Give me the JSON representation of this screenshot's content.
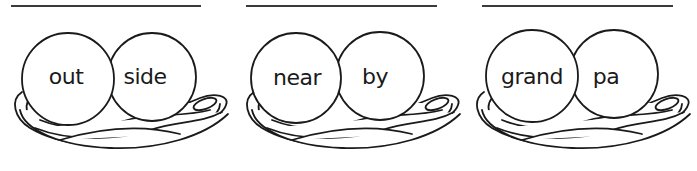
{
  "worksheet": {
    "title": "Compound word nests",
    "colors": {
      "ink": "#1a1a1a",
      "line": "#3a3a3a",
      "background": "#ffffff"
    },
    "panels": [
      {
        "left_word": "out",
        "right_word": "side",
        "answer": ""
      },
      {
        "left_word": "near",
        "right_word": "by",
        "answer": ""
      },
      {
        "left_word": "grand",
        "right_word": "pa",
        "answer": ""
      }
    ]
  }
}
